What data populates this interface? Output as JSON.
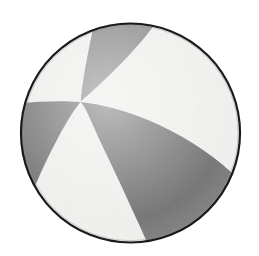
{
  "figure": {
    "kind": "beachball-focal-mechanism-diagram",
    "background_color": "#ffffff",
    "canvas": {
      "width": 259,
      "height": 256
    }
  },
  "circle": {
    "label": "focal-sphere-outline",
    "center_x": 130.5,
    "center_y": 133.0,
    "radius": 110.0,
    "outline_color": "#1a1a1a",
    "outline_width": 2.2,
    "fill_color": "#f1f1ef"
  },
  "colors": {
    "compressional_dark": "#6e6e6e",
    "compressional_dark_upper": "#828282",
    "dilatational_light": "#f1f1ef",
    "outline": "#1a1a1a",
    "background": "#ffffff"
  },
  "nodal_planes": {
    "intersection_point_x": 80.0,
    "intersection_point_y": 102.0,
    "description": "Two nodal planes intersect left of centre, producing four alternating quadrants"
  },
  "quadrants": [
    {
      "name": "upper-wedge",
      "polarity": "compressional",
      "color": "#828282",
      "path": "M 80 102 C 84 76 90 48 95 24 L 152 25 C 140 45 112 79 80 102 Z"
    },
    {
      "name": "right-lobe",
      "polarity": "compressional",
      "color": "#6e6e6e",
      "path": "M 80 102 C 118 108 168 126 208 160 C 222 173 232 186 238 197 C 226 214 208 228 186 236 C 170 222 154 203 140 181 C 114 141 92 114 80 102 Z"
    },
    {
      "name": "left-lobe",
      "polarity": "compressional",
      "color": "#6e6e6e",
      "path": "M 80 102 C 70 114 58 136 48 160 C 40 180 34 198 31 212 C 45 200 60 184 72 166 C 82 150 80 124 80 102 Z"
    },
    {
      "name": "upper-left-light",
      "polarity": "dilatational",
      "color": "#f1f1ef"
    },
    {
      "name": "upper-right-light",
      "polarity": "dilatational",
      "color": "#f1f1ef"
    },
    {
      "name": "lower-light-band",
      "polarity": "dilatational",
      "color": "#f1f1ef"
    }
  ]
}
